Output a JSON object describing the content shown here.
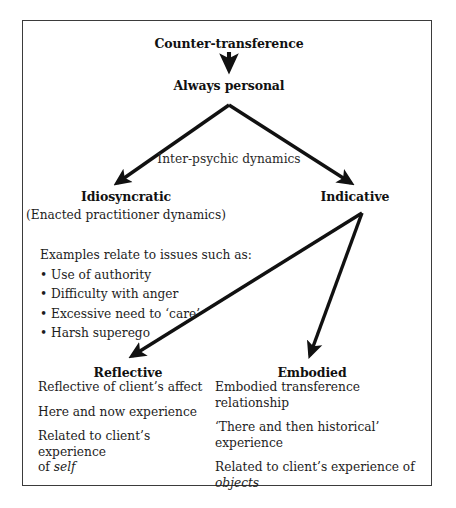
{
  "diagram": {
    "title_node": "Counter-transference",
    "second_node": "Always personal",
    "edge_label": "Inter-psychic dynamics",
    "left_branch": {
      "heading": "Idiosyncratic",
      "subtitle": "(Enacted practitioner dynamics)",
      "examples_intro": "Examples relate to issues such as:",
      "bullets": [
        "Use of authority",
        "Difficulty with anger",
        "Excessive need to ‘care’",
        "Harsh superego"
      ]
    },
    "right_branch": {
      "heading": "Indicative"
    },
    "reflective": {
      "heading": "Reflective",
      "lines": [
        "Reflective of client’s affect",
        "Here and now experience",
        "Related to client’s experience"
      ],
      "last_line_prefix": "of ",
      "last_line_italic": "self"
    },
    "embodied": {
      "heading": "Embodied",
      "line1": "Embodied transference relationship",
      "line2a": "‘There and then historical’",
      "line2b": "experience",
      "line3a": "Related to client’s experience of",
      "line3_italic": "objects"
    },
    "colors": {
      "ink": "#111111",
      "frame": "#3b3b3b",
      "background": "#ffffff"
    }
  }
}
